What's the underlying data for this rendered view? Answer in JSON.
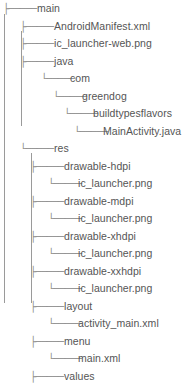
{
  "view": {
    "title": "directory-tree",
    "style": "ascii-tree",
    "text_color": "#555555",
    "line_color": "#9a9a9a",
    "background": "#ffffff"
  },
  "glyphs": {
    "tee": "├─────",
    "elbow": "└─────",
    "pipe": "│"
  },
  "tree": {
    "rows": [
      {
        "label": "main",
        "depth": 0,
        "connector": "tee",
        "indent": 3,
        "text_x": 37
      },
      {
        "label": "AndroidManifest.xml",
        "depth": 1,
        "connector": "tee",
        "indent": 20,
        "text_x": 54
      },
      {
        "label": "ic_launcher-web.png",
        "depth": 1,
        "connector": "tee",
        "indent": 20,
        "text_x": 54
      },
      {
        "label": "java",
        "depth": 1,
        "connector": "tee",
        "indent": 20,
        "text_x": 54
      },
      {
        "label": "com",
        "depth": 2,
        "connector": "elbow",
        "indent": 41,
        "text_x": 70
      },
      {
        "label": "greendog",
        "depth": 3,
        "connector": "elbow",
        "indent": 53,
        "text_x": 82
      },
      {
        "label": "buildtypesflavors",
        "depth": 4,
        "connector": "elbow",
        "indent": 64,
        "text_x": 93
      },
      {
        "label": "MainActivity.java",
        "depth": 5,
        "connector": "elbow",
        "indent": 74,
        "text_x": 103
      },
      {
        "label": "res",
        "depth": 1,
        "connector": "elbow",
        "indent": 20,
        "text_x": 54
      },
      {
        "label": "drawable-hdpi",
        "depth": 2,
        "connector": "tee",
        "indent": 30,
        "text_x": 64
      },
      {
        "label": "ic_launcher.png",
        "depth": 3,
        "connector": "elbow",
        "indent": 48,
        "text_x": 78
      },
      {
        "label": "drawable-mdpi",
        "depth": 2,
        "connector": "tee",
        "indent": 30,
        "text_x": 64
      },
      {
        "label": "ic_launcher.png",
        "depth": 3,
        "connector": "elbow",
        "indent": 48,
        "text_x": 78
      },
      {
        "label": "drawable-xhdpi",
        "depth": 2,
        "connector": "tee",
        "indent": 30,
        "text_x": 64
      },
      {
        "label": "ic_launcher.png",
        "depth": 3,
        "connector": "elbow",
        "indent": 48,
        "text_x": 78
      },
      {
        "label": "drawable-xxhdpi",
        "depth": 2,
        "connector": "tee",
        "indent": 30,
        "text_x": 64
      },
      {
        "label": "ic_launcher.png",
        "depth": 3,
        "connector": "elbow",
        "indent": 48,
        "text_x": 78
      },
      {
        "label": "layout",
        "depth": 2,
        "connector": "tee",
        "indent": 30,
        "text_x": 64
      },
      {
        "label": "activity_main.xml",
        "depth": 3,
        "connector": "elbow",
        "indent": 48,
        "text_x": 78
      },
      {
        "label": "menu",
        "depth": 2,
        "connector": "tee",
        "indent": 30,
        "text_x": 64
      },
      {
        "label": "main.xml",
        "depth": 3,
        "connector": "elbow",
        "indent": 48,
        "text_x": 78
      },
      {
        "label": "values",
        "depth": 2,
        "connector": "tee",
        "indent": 30,
        "text_x": 64
      }
    ],
    "trunks": [
      {
        "x": 4,
        "top": 14,
        "bottom": 303
      },
      {
        "x": 21,
        "top": 31,
        "bottom": 126
      },
      {
        "x": 31,
        "top": 153,
        "bottom": 303
      }
    ]
  }
}
